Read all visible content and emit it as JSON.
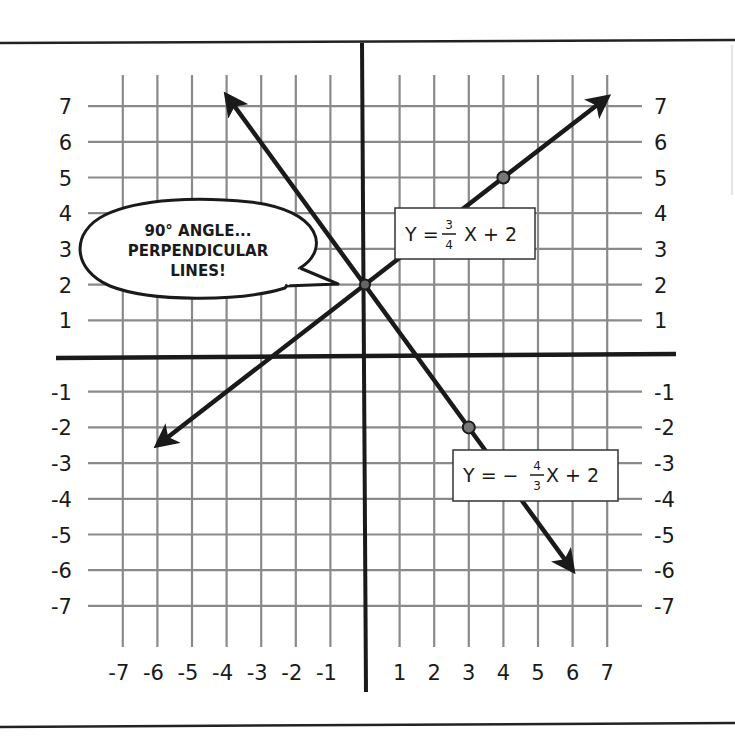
{
  "chart_data": {
    "type": "line",
    "title": "",
    "xlabel": "",
    "ylabel": "",
    "xlim": [
      -7,
      7
    ],
    "ylim": [
      -7,
      7
    ],
    "grid": true,
    "x_ticks": [
      -7,
      -6,
      -5,
      -4,
      -3,
      -2,
      -1,
      1,
      2,
      3,
      4,
      5,
      6,
      7
    ],
    "y_ticks": [
      -7,
      -6,
      -5,
      -4,
      -3,
      -2,
      -1,
      1,
      2,
      3,
      4,
      5,
      6,
      7
    ],
    "x_tick_labels": [
      "-7",
      "-6",
      "-5",
      "-4",
      "-3",
      "-2",
      "-1",
      "1",
      "2",
      "3",
      "4",
      "5",
      "6",
      "7"
    ],
    "y_tick_labels_left": [
      "7",
      "6",
      "5",
      "4",
      "3",
      "2",
      "1",
      "-1",
      "-2",
      "-3",
      "-4",
      "-5",
      "-6",
      "-7"
    ],
    "y_tick_labels_right": [
      "7",
      "6",
      "5",
      "4",
      "3",
      "2",
      "1",
      "-1",
      "-2",
      "-3",
      "-4",
      "-5",
      "-6",
      "-7"
    ],
    "series": [
      {
        "name": "Y = 3/4 X + 2",
        "slope": 0.75,
        "intercept": 2,
        "x": [
          -6,
          7
        ],
        "y": [
          -2.5,
          7.25
        ],
        "arrows": "both",
        "marked_points": [
          [
            0,
            2
          ],
          [
            4,
            5
          ]
        ]
      },
      {
        "name": "Y = -4/3 X + 2",
        "slope": -1.3333,
        "intercept": 2,
        "x": [
          -4,
          6
        ],
        "y": [
          7.3,
          -6
        ],
        "arrows": "both",
        "marked_points": [
          [
            0,
            2
          ],
          [
            3,
            -2
          ]
        ]
      }
    ],
    "intersection": [
      0,
      2
    ],
    "annotations": [
      {
        "type": "callout",
        "lines": [
          "90° ANGLE...",
          "PERPENDICULAR",
          "LINES!"
        ],
        "points_to": [
          0,
          2
        ]
      },
      {
        "type": "label-box",
        "text": "Y = 3/4 X + 2",
        "series": 0
      },
      {
        "type": "label-box",
        "text": "Y = -4/3 X + 2",
        "series": 1
      }
    ],
    "legend": "none"
  },
  "callout": {
    "line1": "90° ANGLE...",
    "line2": "PERPENDICULAR",
    "line3": "LINES!"
  },
  "equations": {
    "eq1": {
      "lhs": "Y =",
      "num": "3",
      "den": "4",
      "rhs": "X + 2"
    },
    "eq2": {
      "lhs": "Y = −",
      "num": "4",
      "den": "3",
      "rhs": "X + 2"
    }
  }
}
